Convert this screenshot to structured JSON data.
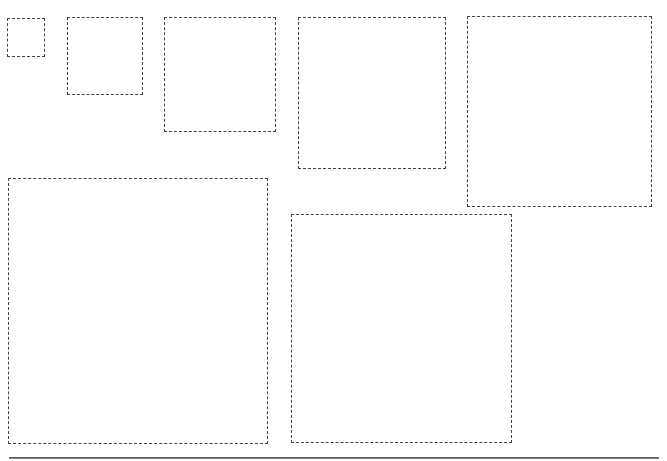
{
  "canvas": {
    "width": 667,
    "height": 461,
    "background": "#ffffff"
  },
  "style": {
    "border_color": "#444444",
    "border_style": "dashed",
    "baseline_color": "#666666"
  },
  "boxes": [
    {
      "id": "box-1",
      "x": 7,
      "y": 18,
      "w": 38,
      "h": 39
    },
    {
      "id": "box-2",
      "x": 67,
      "y": 17,
      "w": 76,
      "h": 78
    },
    {
      "id": "box-3",
      "x": 164,
      "y": 17,
      "w": 112,
      "h": 115
    },
    {
      "id": "box-4",
      "x": 298,
      "y": 17,
      "w": 148,
      "h": 152
    },
    {
      "id": "box-5",
      "x": 467,
      "y": 16,
      "w": 185,
      "h": 191
    },
    {
      "id": "box-6",
      "x": 8,
      "y": 178,
      "w": 260,
      "h": 266
    },
    {
      "id": "box-7",
      "x": 291,
      "y": 214,
      "w": 221,
      "h": 229
    }
  ],
  "baseline": {
    "x": 9,
    "y": 457,
    "w": 650,
    "h": 2
  }
}
